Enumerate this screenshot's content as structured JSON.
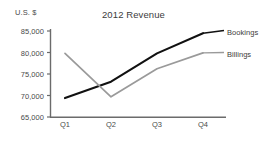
{
  "chart": {
    "title": "2012 Revenue",
    "yaxis_unit_label": "U.S. $",
    "yticks": [
      "85,000",
      "80,000",
      "75,000",
      "70,000",
      "65,000"
    ],
    "xticks": [
      "Q1",
      "Q2",
      "Q3",
      "Q4"
    ],
    "legend": {
      "bookings": "Bookings",
      "billings": "Billings"
    },
    "colors": {
      "bookings_line": "#111111",
      "billings_line": "#9a9a9a",
      "axis": "#6b6b6b",
      "text": "#3c3c3c",
      "background": "#ffffff"
    }
  },
  "chart_data": {
    "type": "line",
    "title": "2012 Revenue",
    "xlabel": "",
    "ylabel": "U.S. $",
    "categories": [
      "Q1",
      "Q2",
      "Q3",
      "Q4"
    ],
    "ylim": [
      65000,
      85000
    ],
    "ytick_values": [
      65000,
      70000,
      75000,
      80000,
      85000
    ],
    "grid": false,
    "legend_position": "right-of-line-ends",
    "series": [
      {
        "name": "Bookings",
        "color": "#111111",
        "values": [
          69400,
          73200,
          79800,
          84500
        ]
      },
      {
        "name": "Billings",
        "color": "#9a9a9a",
        "values": [
          79800,
          69700,
          76200,
          79900
        ]
      }
    ]
  }
}
